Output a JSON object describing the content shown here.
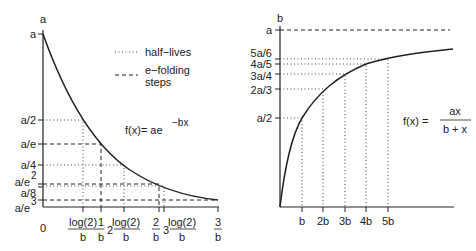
{
  "left_panel": {
    "y_axis_label": "a",
    "y_ticks": [
      "a",
      "a/2",
      "a/e",
      "a/4",
      "a/e²",
      "a/8",
      "a/e³"
    ],
    "y_tick_a": "a",
    "y_tick_half": "a/2",
    "y_tick_e": "a/e",
    "y_tick_quarter": "a/4",
    "y_tick_e2_base": "a/e",
    "y_tick_e2_exp": "2",
    "y_tick_eighth": "a/8",
    "y_tick_e3_base": "a/e",
    "y_tick_e3_exp": "3",
    "x_origin": "0",
    "x_ticks": {
      "t1_num": "log(2)",
      "t1_den": "b",
      "t2_num": "1",
      "t2_den": "b",
      "t3_pre": "2",
      "t3_num": "log(2)",
      "t3_den": "b",
      "t4_num": "2",
      "t4_den": "b",
      "t5_pre": "3",
      "t5_num": "log(2)",
      "t5_den": "b",
      "t6_num": "3",
      "t6_den": "b"
    },
    "legend": {
      "dotted_label": "half−lives",
      "dashed_label_1": "e−folding",
      "dashed_label_2": "steps"
    },
    "formula_main": "f(x)= ae",
    "formula_exp": "−bx"
  },
  "right_panel": {
    "y_axis_label": "b",
    "y_tick_a": "a",
    "y_tick_56": "5a/6",
    "y_tick_45": "4a/5",
    "y_tick_34": "3a/4",
    "y_tick_23": "2a/3",
    "y_tick_12": "a/2",
    "x_ticks": [
      "b",
      "2b",
      "3b",
      "4b",
      "5b"
    ],
    "formula_lhs": "f(x) =",
    "formula_num": "ax",
    "formula_den": "b + x"
  },
  "colors": {
    "ink": "#222222",
    "background": "#ffffff"
  }
}
